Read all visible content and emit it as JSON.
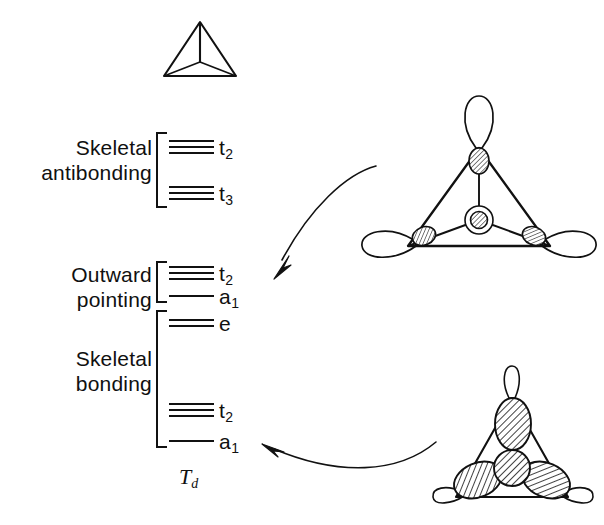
{
  "figure": {
    "point_group": "T",
    "point_group_sub": "d",
    "background_color": "#ffffff",
    "line_color": "#111111"
  },
  "groups": [
    {
      "id": "skeletal-antibonding",
      "line1": "Skeletal",
      "line2": "antibonding",
      "levels": [
        "t2-antibonding",
        "t3-antibonding"
      ]
    },
    {
      "id": "outward-pointing",
      "line1": "Outward",
      "line2": "pointing",
      "levels": [
        "t2-outward",
        "a1-outward"
      ]
    },
    {
      "id": "skeletal-bonding",
      "line1": "Skeletal",
      "line2": "bonding",
      "levels": [
        "e-bonding",
        "t2-bonding",
        "a1-bonding"
      ]
    }
  ],
  "levels": [
    {
      "id": "t2-antibonding",
      "label": "t",
      "sub": "2",
      "degeneracy": 3,
      "y": 146,
      "group": "skeletal-antibonding"
    },
    {
      "id": "t3-antibonding",
      "label": "t",
      "sub": "3",
      "degeneracy": 3,
      "y": 192,
      "group": "skeletal-antibonding"
    },
    {
      "id": "t2-outward",
      "label": "t",
      "sub": "2",
      "degeneracy": 3,
      "y": 272,
      "group": "outward-pointing"
    },
    {
      "id": "a1-outward",
      "label": "a",
      "sub": "1",
      "degeneracy": 1,
      "y": 295,
      "group": "outward-pointing"
    },
    {
      "id": "e-bonding",
      "label": "e",
      "sub": "",
      "degeneracy": 2,
      "y": 322,
      "group": "skeletal-bonding"
    },
    {
      "id": "t2-bonding",
      "label": "t",
      "sub": "2",
      "degeneracy": 3,
      "y": 409,
      "group": "skeletal-bonding"
    },
    {
      "id": "a1-bonding",
      "label": "a",
      "sub": "1",
      "degeneracy": 1,
      "y": 440,
      "group": "skeletal-bonding"
    }
  ],
  "structures": [
    {
      "id": "tetrahedron-top",
      "name": "tetrahedron-skeleton",
      "description": "Plain tetrahedron skeleton drawn in projection"
    },
    {
      "id": "outward-pointing-a1-orbital",
      "name": "outward-pointing-a1-orbital",
      "description": "Tetrahedron with large unshaded outward lobes at each vertex, small hatched inward lobes and hatched central node circle"
    },
    {
      "id": "skeletal-bonding-a1-orbital",
      "name": "skeletal-bonding-a1-orbital",
      "description": "Tetrahedron with large hatched inward lobes and small unshaded outward loops"
    }
  ],
  "arrows": [
    {
      "id": "arrow-outward-a1",
      "from": "outward-pointing-a1-orbital",
      "to": "a1-outward",
      "direction": "down-left"
    },
    {
      "id": "arrow-skeletal-a1",
      "from": "skeletal-bonding-a1-orbital",
      "to": "a1-bonding",
      "direction": "left"
    }
  ]
}
